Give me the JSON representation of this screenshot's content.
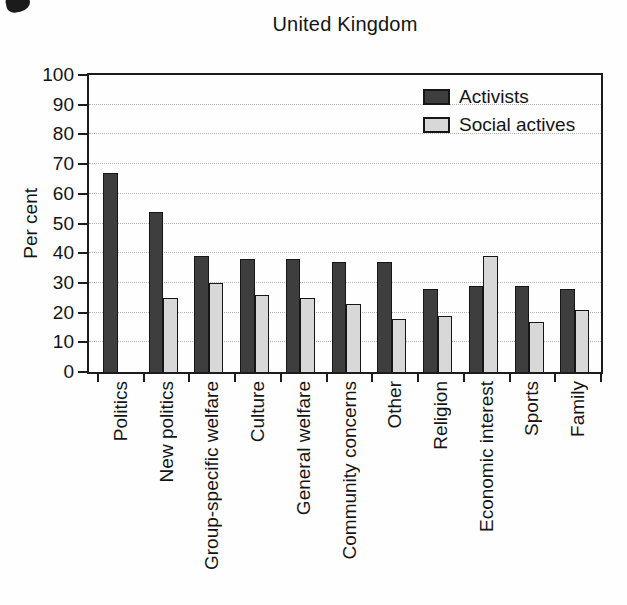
{
  "title": "United Kingdom",
  "colors": {
    "activists_bar": "#3e3e3e",
    "social_actives_bar": "#d8d8d8",
    "frame": "#1c1c1c",
    "gridline": "#b5b5b5",
    "background": "#fefefe"
  },
  "chart_data": {
    "type": "bar",
    "title": "United Kingdom",
    "xlabel": "",
    "ylabel": "Per cent",
    "ylim": [
      0,
      100
    ],
    "ytick_step": 10,
    "yticks": [
      0,
      10,
      20,
      30,
      40,
      50,
      60,
      70,
      80,
      90,
      100
    ],
    "grid": "horizontal-dotted",
    "legend_position": "top-right-inside",
    "categories": [
      "Politics",
      "New politics",
      "Group-specific welfare",
      "Culture",
      "General welfare",
      "Community concerns",
      "Other",
      "Religion",
      "Economic interest",
      "Sports",
      "Family"
    ],
    "series": [
      {
        "name": "Activists",
        "color": "#3e3e3e",
        "values": [
          67,
          54,
          39,
          38,
          38,
          37,
          37,
          28,
          29,
          29,
          28
        ]
      },
      {
        "name": "Social actives",
        "color": "#d8d8d8",
        "values": [
          null,
          25,
          30,
          26,
          25,
          23,
          18,
          19,
          39,
          17,
          21
        ]
      }
    ]
  }
}
